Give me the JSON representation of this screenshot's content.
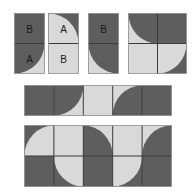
{
  "colors": {
    "dark": "#5e5e5e",
    "light": "#d9d9d9",
    "line": "#3a3a3a",
    "background": "#ffffff"
  },
  "figures": [
    {
      "id": "card-1",
      "x": 14,
      "y": 13,
      "cols": 1,
      "rows": 2,
      "cell_w": 30,
      "cell_h": 30,
      "cells": [
        {
          "type": "solid",
          "fill": "dark",
          "label": "B"
        },
        {
          "type": "quarter",
          "base": "light",
          "arc": "dark",
          "center": "tl",
          "label": "A"
        }
      ]
    },
    {
      "id": "card-2",
      "x": 48,
      "y": 13,
      "cols": 1,
      "rows": 2,
      "cell_w": 30,
      "cell_h": 30,
      "cells": [
        {
          "type": "quarter",
          "base": "dark",
          "arc": "light",
          "center": "bl",
          "label": "A"
        },
        {
          "type": "solid",
          "fill": "light",
          "label": "B"
        }
      ]
    },
    {
      "id": "card-3",
      "x": 88,
      "y": 13,
      "cols": 1,
      "rows": 2,
      "cell_w": 30,
      "cell_h": 30,
      "cells": [
        {
          "type": "solid",
          "fill": "dark",
          "label": "B"
        },
        {
          "type": "quarter",
          "base": "light",
          "arc": "dark",
          "center": "tr",
          "label": ""
        }
      ]
    },
    {
      "id": "grid-2x2",
      "x": 128,
      "y": 13,
      "cols": 2,
      "rows": 2,
      "cell_w": 29,
      "cell_h": 30,
      "cells": [
        {
          "type": "quarter",
          "base": "light",
          "arc": "dark",
          "center": "tr",
          "label": ""
        },
        {
          "type": "solid",
          "fill": "dark",
          "label": ""
        },
        {
          "type": "solid",
          "fill": "light",
          "label": ""
        },
        {
          "type": "quarter",
          "base": "dark",
          "arc": "light",
          "center": "tl",
          "label": ""
        }
      ]
    },
    {
      "id": "strip-5x1",
      "x": 24,
      "y": 85,
      "cols": 5,
      "rows": 1,
      "cell_w": 29.4,
      "cell_h": 30,
      "cells": [
        {
          "type": "solid",
          "fill": "dark",
          "label": ""
        },
        {
          "type": "quarter",
          "base": "light",
          "arc": "dark",
          "center": "tl",
          "label": ""
        },
        {
          "type": "solid",
          "fill": "light",
          "label": ""
        },
        {
          "type": "quarter",
          "base": "light",
          "arc": "dark",
          "center": "br",
          "label": ""
        },
        {
          "type": "solid",
          "fill": "dark",
          "label": ""
        }
      ]
    },
    {
      "id": "grid-5x2",
      "x": 24,
      "y": 125,
      "cols": 5,
      "rows": 2,
      "cell_w": 29.4,
      "cell_h": 30.5,
      "cells": [
        {
          "type": "quarter",
          "base": "dark",
          "arc": "light",
          "center": "br",
          "label": ""
        },
        {
          "type": "solid",
          "fill": "light",
          "label": ""
        },
        {
          "type": "quarter",
          "base": "light",
          "arc": "dark",
          "center": "bl",
          "label": ""
        },
        {
          "type": "solid",
          "fill": "light",
          "label": ""
        },
        {
          "type": "quarter",
          "base": "light",
          "arc": "dark",
          "center": "br",
          "label": ""
        },
        {
          "type": "solid",
          "fill": "dark",
          "label": ""
        },
        {
          "type": "quarter",
          "base": "dark",
          "arc": "light",
          "center": "tr",
          "label": ""
        },
        {
          "type": "solid",
          "fill": "dark",
          "label": ""
        },
        {
          "type": "quarter",
          "base": "dark",
          "arc": "light",
          "center": "tl",
          "label": ""
        },
        {
          "type": "solid",
          "fill": "dark",
          "label": ""
        }
      ]
    }
  ]
}
